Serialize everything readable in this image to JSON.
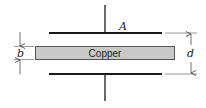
{
  "diagram": {
    "type": "parallel-plate capacitor with inserted slab",
    "plate_label": "A",
    "slab_label": "Copper",
    "slab_thickness_label": "b",
    "plate_separation_label": "d",
    "colors": {
      "line": "#1a1a1a",
      "slab_fill": "#c9c9c9",
      "slab_border": "#555555",
      "dimension": "#333333"
    }
  }
}
